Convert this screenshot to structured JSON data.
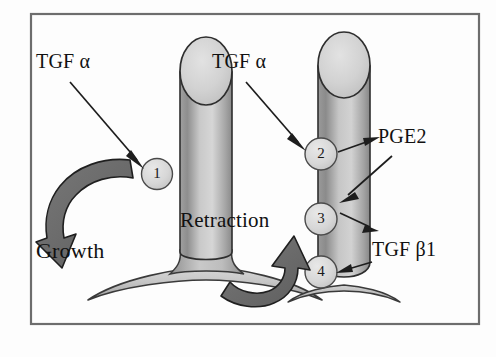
{
  "figure": {
    "frame": {
      "border_color": "#6d6d6d",
      "background_color": "#fdfdfd"
    },
    "palette": {
      "tissue_light": "#d9d9d9",
      "tissue_mid": "#b4b4b4",
      "tissue_dark": "#8f8f8f",
      "outline": "#2a2a2a",
      "arrow_fill": "#6b6b6b",
      "arrow_outline": "#2a2a2a",
      "text": "#111111"
    },
    "labels": {
      "tgf_alpha_left": "TGF α",
      "tgf_alpha_right": "TGF α",
      "pge2": "PGE2",
      "tgf_beta1": "TGF β1",
      "growth": "Growth",
      "retraction": "Retraction"
    },
    "structures": [
      {
        "id": "left-villus",
        "name": "growing villus",
        "state": "Growth",
        "base": "wide splayed base",
        "markers": [
          {
            "number": "1",
            "factor": "TGF α"
          }
        ]
      },
      {
        "id": "right-villus",
        "name": "retracting villus",
        "state": "Retraction",
        "base": "narrow base",
        "markers": [
          {
            "number": "2",
            "factor": "TGF α"
          },
          {
            "number": "3",
            "factor": "PGE2"
          },
          {
            "number": "4",
            "factor": "TGF β1"
          }
        ]
      }
    ],
    "annotation_arrows": [
      {
        "from": "TGF α",
        "to": "marker 1"
      },
      {
        "from": "TGF α",
        "to": "marker 2"
      },
      {
        "from": "marker 2",
        "to": "PGE2"
      },
      {
        "from": "PGE2",
        "to": "marker 3"
      },
      {
        "from": "marker 3",
        "to": "TGF β1"
      },
      {
        "from": "TGF β1",
        "to": "marker 4"
      }
    ],
    "process_arrows": [
      {
        "label": "Growth",
        "direction": "curved downward, left side"
      },
      {
        "label": "Retraction",
        "direction": "curved upward, center-right"
      }
    ]
  }
}
